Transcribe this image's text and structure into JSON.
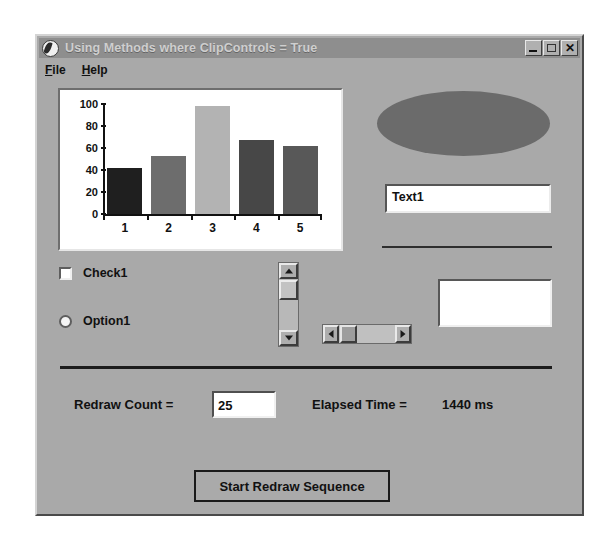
{
  "window": {
    "title": "Using Methods where ClipControls = True",
    "icon": "vb-app-icon",
    "caption_buttons": {
      "minimize": "minimize-icon",
      "maximize": "maximize-icon",
      "close": "✕"
    }
  },
  "menu": {
    "items": [
      {
        "label": "File",
        "accel": "F",
        "rest": "ile"
      },
      {
        "label": "Help",
        "accel": "H",
        "rest": "elp"
      }
    ]
  },
  "chart_data": {
    "type": "bar",
    "title": "",
    "xlabel": "",
    "ylabel": "",
    "categories": [
      "1",
      "2",
      "3",
      "4",
      "5"
    ],
    "values": [
      42,
      53,
      98,
      67,
      62
    ],
    "bar_colors": [
      "#1f1f1f",
      "#6d6d6d",
      "#b3b3b3",
      "#474747",
      "#585858"
    ],
    "ylim": [
      0,
      100
    ],
    "yticks": [
      0,
      20,
      40,
      60,
      80,
      100
    ],
    "grid": false,
    "legend": false,
    "background": "#ffffff"
  },
  "shapes": {
    "ellipse": {
      "name": "ellipse-shape",
      "fill": "#6b6b6b"
    }
  },
  "text1": {
    "value": "Text1",
    "placeholder": ""
  },
  "controls": {
    "checkbox": {
      "label": "Check1",
      "checked": false
    },
    "option": {
      "label": "Option1",
      "selected": false
    },
    "vscrollbar": {
      "name": "vertical-scrollbar",
      "up_arrow": "scroll-up-icon",
      "down_arrow": "scroll-down-icon"
    },
    "hscrollbar": {
      "name": "horizontal-scrollbar",
      "left_arrow": "scroll-left-icon",
      "right_arrow": "scroll-right-icon"
    },
    "blank_panel": {
      "value": ""
    }
  },
  "status": {
    "redraw_count_label": "Redraw Count =",
    "redraw_count_value": "25",
    "elapsed_time_label": "Elapsed Time =",
    "elapsed_time_value": "1440 ms"
  },
  "actions": {
    "start_button": "Start Redraw Sequence"
  },
  "colors": {
    "window_face": "#a9a9a9",
    "titlebar": "#8e8e8e",
    "titlebar_text": "#cfcfcf",
    "field_bg": "#ffffff",
    "separator": "#1c1c1c"
  }
}
